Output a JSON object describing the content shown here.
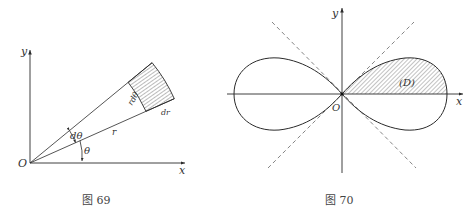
{
  "figures": [
    {
      "id": "fig69",
      "caption": "图 69",
      "labels": {
        "y_axis": "y",
        "x_axis": "x",
        "origin": "O",
        "dtheta": "dθ",
        "theta": "θ",
        "r": "r",
        "rdtheta": "rdθ",
        "dr": "dr"
      }
    },
    {
      "id": "fig70",
      "caption": "图 70",
      "labels": {
        "y_axis": "y",
        "x_axis": "x",
        "origin": "O",
        "region": "(D)"
      }
    }
  ],
  "colors": {
    "line": "#2a2a2a",
    "hatch": "#555555",
    "dash": "#666666"
  }
}
